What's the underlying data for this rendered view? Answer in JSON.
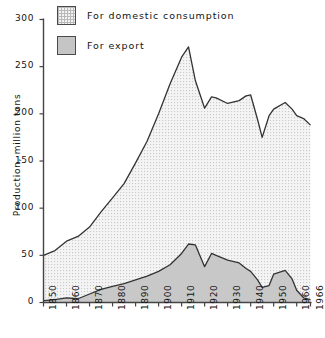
{
  "chart_data": {
    "type": "area",
    "title": "",
    "subtitle": "",
    "xlabel": "",
    "ylabel": "Production, million tons",
    "xlim": [
      1850,
      1966
    ],
    "ylim": [
      0,
      300
    ],
    "grid": false,
    "stacked": true,
    "legend_position": "top-left",
    "x_ticks": [
      "1850",
      "1860",
      "1870",
      "1880",
      "1890",
      "1900",
      "1910",
      "1920",
      "1930",
      "1940",
      "1950",
      "1960",
      "1966"
    ],
    "x_tick_values": [
      1850,
      1860,
      1870,
      1880,
      1890,
      1900,
      1910,
      1920,
      1930,
      1940,
      1950,
      1960,
      1966
    ],
    "y_ticks": [
      "0",
      "50",
      "100",
      "150",
      "200",
      "250",
      "300"
    ],
    "y_tick_values": [
      0,
      50,
      100,
      150,
      200,
      250,
      300
    ],
    "legend": [
      {
        "label": "For domestic consumption",
        "swatch": "dotted-grid",
        "color": "#f2f2f2"
      },
      {
        "label": "For export",
        "swatch": "solid-gray",
        "color": "#c5c5c5"
      }
    ],
    "x": [
      1850,
      1855,
      1860,
      1865,
      1870,
      1875,
      1880,
      1885,
      1890,
      1895,
      1900,
      1905,
      1910,
      1913,
      1916,
      1920,
      1923,
      1925,
      1930,
      1935,
      1938,
      1940,
      1943,
      1945,
      1948,
      1950,
      1955,
      1958,
      1960,
      1963,
      1966
    ],
    "series": [
      {
        "name": "For export",
        "color": "#c5c5c5",
        "values": [
          2,
          3,
          5,
          4,
          9,
          14,
          17,
          20,
          24,
          28,
          33,
          40,
          52,
          62,
          61,
          38,
          52,
          50,
          45,
          42,
          36,
          33,
          24,
          16,
          18,
          30,
          34,
          25,
          13,
          5,
          3
        ]
      },
      {
        "name": "For domestic consumption",
        "color": "#f2f2f2",
        "values": [
          48,
          52,
          60,
          66,
          71,
          82,
          94,
          106,
          124,
          143,
          167,
          192,
          208,
          209,
          174,
          168,
          166,
          167,
          166,
          172,
          183,
          187,
          170,
          159,
          180,
          175,
          178,
          180,
          185,
          190,
          185
        ]
      }
    ],
    "totals": [
      50,
      55,
      65,
      70,
      80,
      96,
      111,
      126,
      148,
      171,
      200,
      232,
      260,
      271,
      235,
      206,
      218,
      217,
      211,
      214,
      219,
      220,
      194,
      175,
      198,
      205,
      212,
      205,
      198,
      195,
      188
    ],
    "annotations": [
      {
        "text": "Peak total production approx. 271 million tons near 1913"
      },
      {
        "text": "Wartime minimum approx. 175 million tons near 1945"
      }
    ]
  },
  "legend": {
    "items": [
      {
        "label": "For domestic consumption"
      },
      {
        "label": "For export"
      }
    ]
  },
  "axes": {
    "y_title": "Production, million tons"
  }
}
